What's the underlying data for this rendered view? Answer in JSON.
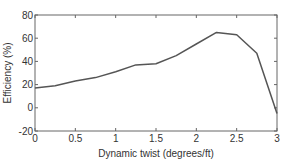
{
  "chart_data": {
    "type": "line",
    "title": "",
    "xlabel": "Dynamic twist (degrees/ft)",
    "ylabel": "Efficiency (%)",
    "xlim": [
      0,
      3
    ],
    "ylim": [
      -20,
      80
    ],
    "xticks": [
      0,
      0.5,
      1,
      1.5,
      2,
      2.5,
      3
    ],
    "xtick_labels": [
      "0",
      "0.5",
      "1",
      "1.5",
      "2",
      "2.5",
      "3"
    ],
    "yticks": [
      -20,
      0,
      20,
      40,
      60,
      80
    ],
    "ytick_labels": [
      "-20",
      "0",
      "20",
      "40",
      "60",
      "80"
    ],
    "grid": false,
    "legend": null,
    "series": [
      {
        "name": "Efficiency",
        "color": "#555555",
        "x": [
          0,
          0.25,
          0.5,
          0.75,
          1.0,
          1.25,
          1.5,
          1.75,
          2.0,
          2.25,
          2.5,
          2.75,
          3.0
        ],
        "values": [
          17,
          19,
          23,
          26,
          31,
          37,
          38,
          45,
          55,
          65,
          63,
          47,
          -5
        ]
      }
    ]
  }
}
